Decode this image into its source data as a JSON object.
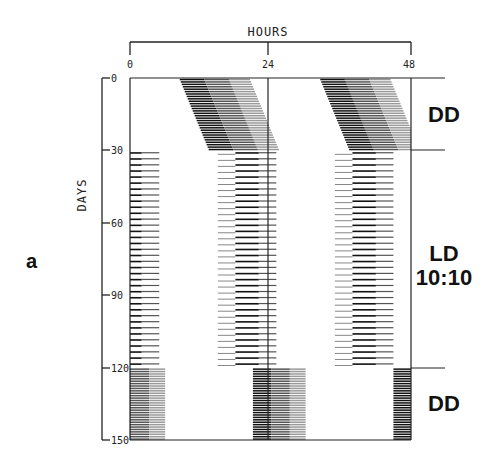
{
  "panel_label": "a",
  "chart_data": {
    "type": "actogram",
    "title": "",
    "xlabel": "HOURS",
    "ylabel": "DAYS",
    "x_ticks": [
      "0",
      "24",
      "48"
    ],
    "x_range": [
      0,
      48
    ],
    "y_ticks": [
      "0",
      "30",
      "60",
      "90",
      "120",
      "150"
    ],
    "y_range": [
      0,
      150
    ],
    "double_plotted": true,
    "grid": false,
    "segments": [
      {
        "condition": "DD",
        "label": "DD",
        "day_start": 0,
        "day_end": 30,
        "onset_start_hour": 8.5,
        "onset_drift_per_day": 0.17,
        "active_duration_hours": 12
      },
      {
        "condition": "LD 10:10",
        "label": "LD\n10:10",
        "day_start": 30,
        "day_end": 120,
        "period_hours": 20,
        "light_hours": 10,
        "dark_hours": 10
      },
      {
        "condition": "DD",
        "label": "DD",
        "day_start": 120,
        "day_end": 150,
        "onset_hour": 21,
        "active_duration_hours": 9
      }
    ],
    "condition_labels": [
      "DD",
      "LD 10:10",
      "DD"
    ],
    "condition_boundaries_days": [
      0,
      30,
      120
    ]
  },
  "labels": {
    "hours": "HOURS",
    "days": "DAYS",
    "dd_top": "DD",
    "ld_line1": "LD",
    "ld_line2": "10:10",
    "dd_bottom": "DD"
  }
}
